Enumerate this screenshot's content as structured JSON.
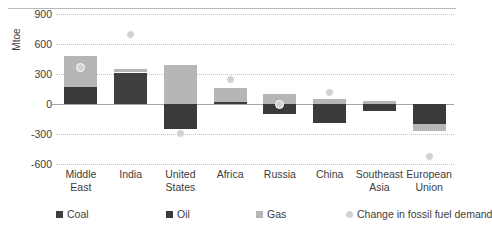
{
  "chart_data": {
    "type": "bar",
    "title": "",
    "subtitle": "",
    "xlabel": "",
    "ylabel": "Mtoe",
    "ylim": [
      -600,
      900
    ],
    "yticks": [
      900,
      600,
      300,
      0,
      -300,
      -600
    ],
    "ytick_labels": [
      "900",
      "600",
      "300",
      "0",
      "-300",
      "-600"
    ],
    "grid": true,
    "stacked": true,
    "legend_position": "bottom",
    "categories": [
      "Middle East",
      "India",
      "United States",
      "Africa",
      "Russia",
      "China",
      "Southeast Asia",
      "European Union"
    ],
    "series": [
      {
        "name": "Coal",
        "color": "#3f3f3f",
        "values": [
          0,
          315,
          0,
          0,
          0,
          0,
          0,
          0
        ]
      },
      {
        "name": "Oil",
        "color": "#3a3a3a",
        "values": [
          175,
          0,
          -250,
          20,
          -100,
          -185,
          -65,
          -195
        ]
      },
      {
        "name": "Gas",
        "color": "#b6b6b6",
        "values": [
          305,
          33,
          390,
          140,
          100,
          55,
          35,
          -70
        ]
      }
    ],
    "overlay_series": {
      "name": "Change in fossil fuel demand",
      "type": "scatter",
      "color": "#d2d2d2",
      "values": [
        370,
        700,
        -290,
        250,
        0,
        120,
        null,
        -520
      ]
    }
  },
  "legend": {
    "items": [
      {
        "label": "Coal",
        "marker": "square",
        "color": "#3f3f3f"
      },
      {
        "label": "Oil",
        "marker": "square",
        "color": "#3a3a3a"
      },
      {
        "label": "Gas",
        "marker": "square",
        "color": "#b6b6b6"
      },
      {
        "label": "Change in fossil fuel demand",
        "marker": "circle",
        "color": "#d2d2d2"
      }
    ]
  }
}
